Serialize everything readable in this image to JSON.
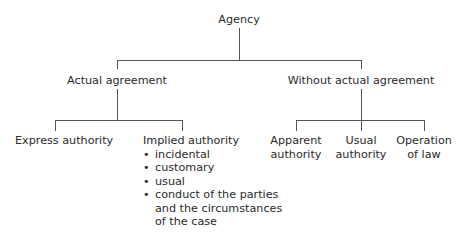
{
  "diagram": {
    "type": "tree",
    "root": {
      "label": "Agency",
      "children": [
        {
          "label": "Actual agreement",
          "children": [
            {
              "label": "Express authority"
            },
            {
              "label": "Implied authority",
              "bullets": [
                "incidental",
                "customary",
                "usual",
                "conduct of the parties and the circumstances of the case"
              ]
            }
          ]
        },
        {
          "label": "Without actual agreement",
          "children": [
            {
              "label_lines": [
                "Apparent",
                "authority"
              ]
            },
            {
              "label_lines": [
                "Usual",
                "authority"
              ]
            },
            {
              "label_lines": [
                "Operation",
                "of law"
              ]
            }
          ]
        }
      ]
    },
    "bullet_lines": {
      "conduct": [
        "conduct of the parties",
        "and the circumstances",
        "of the case"
      ]
    }
  }
}
